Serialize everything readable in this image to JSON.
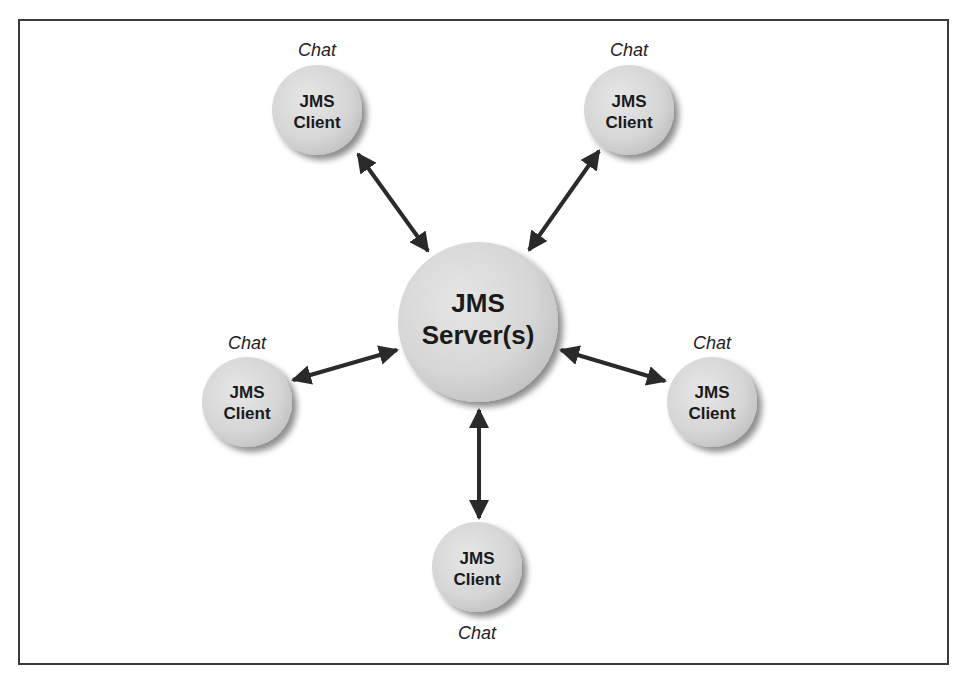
{
  "diagram": {
    "colors": {
      "node_fill": "#d8d8d8",
      "node_highlight": "#ececec",
      "node_shadow": "#9a9a9a",
      "arrow": "#2a2a2a",
      "border": "#3a3a3a",
      "text": "#1a1a1a"
    },
    "server": {
      "line1": "JMS",
      "line2": "Server(s)"
    },
    "clients": [
      {
        "position": "top-left",
        "line1": "JMS",
        "line2": "Client",
        "caption": "Chat"
      },
      {
        "position": "top-right",
        "line1": "JMS",
        "line2": "Client",
        "caption": "Chat"
      },
      {
        "position": "left",
        "line1": "JMS",
        "line2": "Client",
        "caption": "Chat"
      },
      {
        "position": "right",
        "line1": "JMS",
        "line2": "Client",
        "caption": "Chat"
      },
      {
        "position": "bottom",
        "line1": "JMS",
        "line2": "Client",
        "caption": "Chat"
      }
    ],
    "connections": [
      {
        "from": "server",
        "to": "client-top-left",
        "type": "bidirectional"
      },
      {
        "from": "server",
        "to": "client-top-right",
        "type": "bidirectional"
      },
      {
        "from": "server",
        "to": "client-left",
        "type": "bidirectional"
      },
      {
        "from": "server",
        "to": "client-right",
        "type": "bidirectional"
      },
      {
        "from": "server",
        "to": "client-bottom",
        "type": "bidirectional"
      }
    ]
  }
}
